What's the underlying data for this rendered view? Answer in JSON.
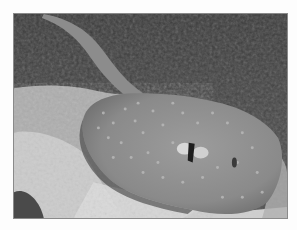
{
  "image": {
    "subject": "stingray resting on seafloor",
    "style": "grayscale photograph",
    "colors": {
      "page_background": "#fdfdfd",
      "frame_border": "#8a8a8a",
      "background_dark": "#3e3e3e",
      "seafloor_light": "#c9c9c9",
      "ray_body": "#8e8e8e",
      "ray_spots": "#b4b4b4"
    }
  }
}
